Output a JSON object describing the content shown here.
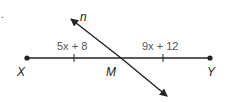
{
  "diagram": {
    "marker": ".",
    "segment": {
      "start_label": "X",
      "end_label": "Y",
      "midpoint_label": "M",
      "left_expression": "5x + 8",
      "right_expression": "9x + 12"
    },
    "bisector": {
      "label": "n"
    },
    "colors": {
      "line": "#222222",
      "expression_text": "#555555"
    }
  }
}
